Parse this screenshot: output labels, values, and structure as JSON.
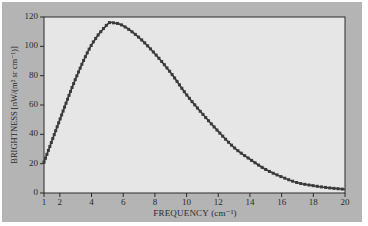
{
  "chart_data": {
    "type": "line",
    "title": "",
    "xlabel": "FREQUENCY (cm⁻¹)",
    "ylabel": "BRIGHTNESS [nW/(m² sr cm⁻¹)]",
    "xlim": [
      1,
      20
    ],
    "ylim": [
      0,
      120
    ],
    "xticks": [
      1,
      2,
      4,
      6,
      8,
      10,
      12,
      14,
      16,
      18,
      20
    ],
    "yticks": [
      0,
      20,
      40,
      60,
      80,
      100,
      120
    ],
    "grid": false,
    "legend": null,
    "series": [
      {
        "name": "brightness",
        "marker": "square",
        "color": "#3a3a3a",
        "x": [
          1,
          2,
          3,
          4,
          5,
          5.4,
          6,
          7,
          8,
          9,
          10,
          11,
          12,
          13,
          14,
          15,
          16,
          17,
          18,
          19,
          20
        ],
        "y": [
          21,
          50,
          78,
          101,
          115,
          116,
          114,
          106,
          95,
          82,
          67,
          54,
          42,
          31,
          23,
          16,
          11,
          7,
          5,
          3.5,
          2.5
        ]
      }
    ]
  },
  "colors": {
    "frame": "#b4b4b4",
    "plot_background": "#e6e6e6",
    "line": "#3a3a3a",
    "axis": "#2a2a2a"
  }
}
